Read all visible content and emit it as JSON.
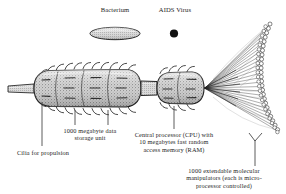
{
  "figure": {
    "title_none": "",
    "background_color": "#ffffff",
    "ink_color": "#1d1d1d"
  },
  "scale_reference": {
    "bacterium": {
      "label": "Bacterium",
      "shape_name": "stippled-ellipse"
    },
    "aids_virus": {
      "label": "AIDS Virus",
      "shape_name": "solid-dot"
    }
  },
  "nanorobot": {
    "parts": [
      {
        "id": "cilia",
        "label": "Cilia for propulsion",
        "shape_name": "cilia-fringe"
      },
      {
        "id": "storage",
        "label": "1000 megabyte data\nstorage unit",
        "shape_name": "storage-capsule"
      },
      {
        "id": "cpu",
        "label": "Central processor (CPU) with\n10 megabytes fast random\naccess memory (RAM)",
        "shape_name": "cpu-segment"
      },
      {
        "id": "manipulators",
        "label": "1000 extendable molecular\nmanipulators (each is micro-\nprocessor controlled)",
        "shape_name": "manipulator-fan"
      }
    ]
  }
}
